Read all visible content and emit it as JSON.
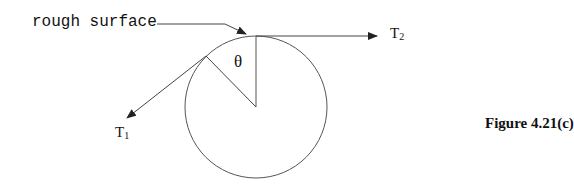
{
  "diagram": {
    "surface_label": "rough surface",
    "theta_label": "θ",
    "t1": {
      "base": "T",
      "sub": "1"
    },
    "t2": {
      "base": "T",
      "sub": "2"
    },
    "caption": "Figure 4.21(c)",
    "stroke_color": "#333333"
  }
}
